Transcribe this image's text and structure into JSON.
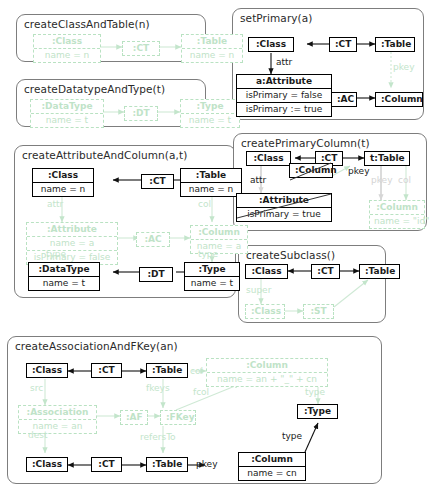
{
  "figure": {
    "type": "graph-transformation-rules",
    "title": "",
    "colors": {
      "panel_border": "#7d7d7d",
      "node_border": "#000000",
      "created_green": "#bfe3c8",
      "context_grey": "#d2d2d2",
      "text": "#1a1a1a"
    }
  },
  "rules": [
    {
      "id": "createClassAndTable",
      "title": "createClassAndTable(n)",
      "nodes": [
        {
          "name": "class-node",
          "header": ":Class",
          "slots": [
            "name = n"
          ],
          "style": "green"
        },
        {
          "name": "ct-node",
          "header": ":CT",
          "slots": [],
          "style": "green"
        },
        {
          "name": "table-node",
          "header": ":Table",
          "slots": [
            "name = n"
          ],
          "style": "green"
        }
      ],
      "edges": []
    },
    {
      "id": "createDatatypeAndType",
      "title": "createDatatypeAndType(t)",
      "nodes": [
        {
          "name": "datatype-node",
          "header": ":DataType",
          "slots": [
            "name = t"
          ],
          "style": "green"
        },
        {
          "name": "dt-node",
          "header": ":DT",
          "slots": [],
          "style": "green"
        },
        {
          "name": "type-node",
          "header": ":Type",
          "slots": [
            "name = t"
          ],
          "style": "green"
        }
      ],
      "edges": []
    },
    {
      "id": "createAttributeAndColumn",
      "title": "createAttributeAndColumn(a,t)",
      "nodes": [
        {
          "name": "class-node",
          "header": ":Class",
          "slots": [
            "name = n"
          ],
          "style": "solid"
        },
        {
          "name": "ct-node",
          "header": ":CT",
          "slots": [],
          "style": "solid"
        },
        {
          "name": "table-node",
          "header": ":Table",
          "slots": [
            "name = n"
          ],
          "style": "solid"
        },
        {
          "name": "attribute-node",
          "header": ":Attribute",
          "slots": [
            "name = a",
            "isPrimary = false"
          ],
          "style": "green"
        },
        {
          "name": "ac-node",
          "header": ":AC",
          "slots": [],
          "style": "green"
        },
        {
          "name": "column-node",
          "header": ":Column",
          "slots": [
            "name = a"
          ],
          "style": "green"
        },
        {
          "name": "datatype-node",
          "header": ":DataType",
          "slots": [
            "name = t"
          ],
          "style": "solid"
        },
        {
          "name": "dt-node",
          "header": ":DT",
          "slots": [],
          "style": "solid"
        },
        {
          "name": "type-node",
          "header": ":Type",
          "slots": [
            "name = t"
          ],
          "style": "solid"
        }
      ],
      "edges": [
        {
          "label": "attr",
          "style": "green"
        },
        {
          "label": "col",
          "style": "green"
        },
        {
          "label": "type",
          "style": "green"
        },
        {
          "label": "type",
          "style": "green"
        }
      ]
    },
    {
      "id": "createAssociationAndFKey",
      "title": "createAssociationAndFKey(an)",
      "nodes": [
        {
          "name": "class-src-node",
          "header": ":Class",
          "slots": [],
          "style": "solid"
        },
        {
          "name": "ct-src-node",
          "header": ":CT",
          "slots": [],
          "style": "solid"
        },
        {
          "name": "table-src-node",
          "header": ":Table",
          "slots": [],
          "style": "solid"
        },
        {
          "name": "column-new-node",
          "header": ":Column",
          "slots": [
            "name = an + \"_\" + cn"
          ],
          "style": "green"
        },
        {
          "name": "association-node",
          "header": ":Association",
          "slots": [
            "name = an"
          ],
          "style": "green"
        },
        {
          "name": "af-node",
          "header": ":AF",
          "slots": [],
          "style": "green"
        },
        {
          "name": "fkey-node",
          "header": ":FKey",
          "slots": [],
          "style": "green"
        },
        {
          "name": "type-node",
          "header": ":Type",
          "slots": [],
          "style": "solid"
        },
        {
          "name": "class-dest-node",
          "header": ":Class",
          "slots": [],
          "style": "solid"
        },
        {
          "name": "ct-dest-node",
          "header": ":CT",
          "slots": [],
          "style": "solid"
        },
        {
          "name": "table-dest-node",
          "header": ":Table",
          "slots": [],
          "style": "solid"
        },
        {
          "name": "column-pkey-node",
          "header": ":Column",
          "slots": [
            "name = cn"
          ],
          "style": "solid"
        }
      ],
      "edges": [
        {
          "label": "src",
          "style": "green"
        },
        {
          "label": "dest",
          "style": "green"
        },
        {
          "label": "col",
          "style": "green"
        },
        {
          "label": "fkeys",
          "style": "green"
        },
        {
          "label": "fcol",
          "style": "green"
        },
        {
          "label": "type",
          "style": "green"
        },
        {
          "label": "refersTo",
          "style": "green"
        },
        {
          "label": "pkey",
          "style": "solid"
        },
        {
          "label": "type",
          "style": "solid"
        }
      ]
    },
    {
      "id": "setPrimary",
      "title": "setPrimary(a)",
      "nodes": [
        {
          "name": "class-node",
          "header": ":Class",
          "slots": [],
          "style": "solid"
        },
        {
          "name": "ct-node",
          "header": ":CT",
          "slots": [],
          "style": "solid"
        },
        {
          "name": "table-node",
          "header": ":Table",
          "slots": [],
          "style": "solid"
        },
        {
          "name": "attribute-node",
          "header": "a:Attribute",
          "slots": [
            "isPrimary = false",
            "isPrimary := true"
          ],
          "style": "solid"
        },
        {
          "name": "ac-node",
          "header": ":AC",
          "slots": [],
          "style": "solid"
        },
        {
          "name": "column-node",
          "header": ":Column",
          "slots": [],
          "style": "solid"
        }
      ],
      "edges": [
        {
          "label": "attr",
          "style": "solid"
        },
        {
          "label": "pkey",
          "style": "green"
        }
      ]
    },
    {
      "id": "createPrimaryColumn",
      "title": "createPrimaryColumn(t)",
      "nodes": [
        {
          "name": "class-node",
          "header": ":Class",
          "slots": [],
          "style": "solid"
        },
        {
          "name": "ct-node",
          "header": ":CT",
          "slots": [],
          "style": "solid"
        },
        {
          "name": "table-node",
          "header": "t:Table",
          "slots": [],
          "style": "solid"
        },
        {
          "name": "attribute-nac",
          "header": ":Attribute",
          "slots": [
            "isPrimary = true"
          ],
          "style": "nac"
        },
        {
          "name": "column-nac",
          "header": ":Column",
          "slots": [],
          "style": "nac"
        },
        {
          "name": "column-created",
          "header": ":Column",
          "slots": [
            "name = \"id\""
          ],
          "style": "green"
        }
      ],
      "edges": [
        {
          "label": "attr",
          "style": "nac"
        },
        {
          "label": "pkey",
          "style": "nac"
        },
        {
          "label": "pkey",
          "style": "green"
        },
        {
          "label": "col",
          "style": "green"
        }
      ]
    },
    {
      "id": "createSubclass",
      "title": "createSubclass()",
      "nodes": [
        {
          "name": "class-node",
          "header": ":Class",
          "slots": [],
          "style": "solid"
        },
        {
          "name": "ct-node",
          "header": ":CT",
          "slots": [],
          "style": "solid"
        },
        {
          "name": "table-node",
          "header": ":Table",
          "slots": [],
          "style": "solid"
        },
        {
          "name": "class-sub-node",
          "header": ":Class",
          "slots": [],
          "style": "green"
        },
        {
          "name": "st-node",
          "header": ":ST",
          "slots": [],
          "style": "green"
        }
      ],
      "edges": [
        {
          "label": "super",
          "style": "green"
        }
      ]
    }
  ]
}
